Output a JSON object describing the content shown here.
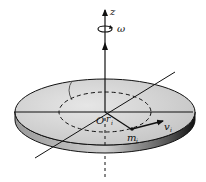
{
  "figure": {
    "labels": {
      "z_axis": "z",
      "angular_velocity": "ω",
      "origin": "O",
      "radius": "r",
      "radius_sub": "i",
      "mass": "m",
      "mass_sub": "i",
      "velocity": "v",
      "velocity_sub": "i"
    },
    "colors": {
      "line": "#111111",
      "disk_top": "#d9d9d9",
      "disk_edge": "#2a2a2a",
      "background": "#ffffff"
    }
  }
}
